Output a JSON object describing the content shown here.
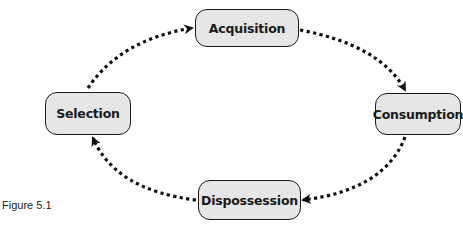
{
  "diagram": {
    "type": "cycle",
    "nodes": [
      {
        "id": "acquisition",
        "label": "Acquisition"
      },
      {
        "id": "consumption",
        "label": "Consumption"
      },
      {
        "id": "dispossession",
        "label": "Dispossession"
      },
      {
        "id": "selection",
        "label": "Selection"
      }
    ],
    "edges": [
      {
        "from": "acquisition",
        "to": "consumption",
        "style": "dotted"
      },
      {
        "from": "consumption",
        "to": "dispossession",
        "style": "dotted"
      },
      {
        "from": "dispossession",
        "to": "selection",
        "style": "dotted"
      },
      {
        "from": "selection",
        "to": "acquisition",
        "style": "dotted"
      }
    ],
    "colors": {
      "node_fill": "#e6e6e6",
      "stroke": "#1a1a1a"
    }
  },
  "caption": "Figure 5.1"
}
